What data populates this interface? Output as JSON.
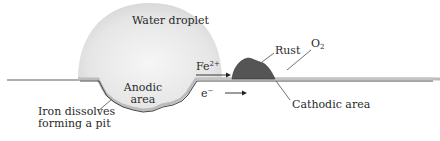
{
  "diagram": {
    "labels": {
      "water_droplet": "Water droplet",
      "fe_base": "Fe",
      "fe_charge": "2+",
      "anodic_line1": "Anodic",
      "anodic_line2": "area",
      "electron_base": "e",
      "electron_charge": "−",
      "rust": "Rust",
      "oxygen_base": "O",
      "oxygen_sub": "2",
      "cathodic": "Cathodic area",
      "pit_line1": "Iron dissolves",
      "pit_line2": "forming a pit"
    },
    "colors": {
      "droplet_fill": "#e4e4e4",
      "droplet_highlight": "#f4f4f4",
      "iron_surface": "#bdbdbd",
      "outline": "#333333",
      "rust_fill": "#555555",
      "text": "#2a2a2a"
    }
  }
}
